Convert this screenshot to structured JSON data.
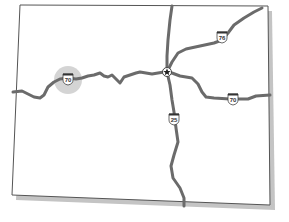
{
  "map": {
    "colors": {
      "background": "#ffffff",
      "outline": "#555555",
      "shadow": "#b8b8b8",
      "road": "#6b6b6b",
      "highlight": "#c8c8c8",
      "shield_fill": "#ffffff",
      "shield_top": "#333333",
      "capital": "#222222"
    },
    "highways": [
      {
        "id": "I-70",
        "label": "70",
        "type": "interstate"
      },
      {
        "id": "I-76",
        "label": "76",
        "type": "interstate"
      },
      {
        "id": "I-25",
        "label": "25",
        "type": "interstate"
      }
    ],
    "shields": [
      {
        "label": "70",
        "x": 68,
        "y": 79,
        "highlighted": true
      },
      {
        "label": "76",
        "x": 222,
        "y": 37,
        "highlighted": false
      },
      {
        "label": "70",
        "x": 233,
        "y": 99,
        "highlighted": false
      },
      {
        "label": "25",
        "x": 174,
        "y": 119,
        "highlighted": false
      }
    ],
    "capital": {
      "symbol": "star",
      "x": 167,
      "y": 72
    },
    "highlight_marker": {
      "x": 68,
      "y": 80,
      "r": 14
    }
  }
}
